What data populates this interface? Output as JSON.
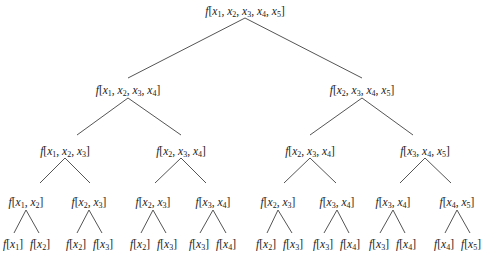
{
  "diagram": {
    "type": "binary-tree",
    "edge_color": "#555555",
    "nodes": [
      {
        "id": "n0",
        "label": "f[x1, x2, x3, x4, x5]",
        "args": [
          1,
          2,
          3,
          4,
          5
        ],
        "x": 245,
        "y": 12
      },
      {
        "id": "n1",
        "label": "f[x1, x2, x3, x4]",
        "args": [
          1,
          2,
          3,
          4
        ],
        "x": 128,
        "y": 91
      },
      {
        "id": "n2",
        "label": "f[x2, x3, x4, x5]",
        "args": [
          2,
          3,
          4,
          5
        ],
        "x": 362,
        "y": 91
      },
      {
        "id": "n3",
        "label": "f[x1, x2, x3]",
        "args": [
          1,
          2,
          3
        ],
        "x": 65,
        "y": 152
      },
      {
        "id": "n4",
        "label": "f[x2, x3, x4]",
        "args": [
          2,
          3,
          4
        ],
        "x": 181,
        "y": 152
      },
      {
        "id": "n5",
        "label": "f[x2, x3, x4]",
        "args": [
          2,
          3,
          4
        ],
        "x": 310,
        "y": 152
      },
      {
        "id": "n6",
        "label": "f[x3, x4, x5]",
        "args": [
          3,
          4,
          5
        ],
        "x": 425,
        "y": 152
      },
      {
        "id": "n7",
        "label": "f[x1, x2]",
        "args": [
          1,
          2
        ],
        "x": 26,
        "y": 203
      },
      {
        "id": "n8",
        "label": "f[x2, x3]",
        "args": [
          2,
          3
        ],
        "x": 89,
        "y": 203
      },
      {
        "id": "n9",
        "label": "f[x2, x3]",
        "args": [
          2,
          3
        ],
        "x": 153,
        "y": 203
      },
      {
        "id": "n10",
        "label": "f[x3, x4]",
        "args": [
          3,
          4
        ],
        "x": 213,
        "y": 203
      },
      {
        "id": "n11",
        "label": "f[x2, x3]",
        "args": [
          2,
          3
        ],
        "x": 278,
        "y": 203
      },
      {
        "id": "n12",
        "label": "f[x3, x4]",
        "args": [
          3,
          4
        ],
        "x": 337,
        "y": 203
      },
      {
        "id": "n13",
        "label": "f[x3, x4]",
        "args": [
          3,
          4
        ],
        "x": 393,
        "y": 203
      },
      {
        "id": "n14",
        "label": "f[x4, x5]",
        "args": [
          4,
          5
        ],
        "x": 457,
        "y": 203
      },
      {
        "id": "l0",
        "label": "f[x1]",
        "args": [
          1
        ],
        "x": 13,
        "y": 245
      },
      {
        "id": "l1",
        "label": "f[x2]",
        "args": [
          2
        ],
        "x": 40,
        "y": 245
      },
      {
        "id": "l2",
        "label": "f[x2]",
        "args": [
          2
        ],
        "x": 76,
        "y": 245
      },
      {
        "id": "l3",
        "label": "f[x3]",
        "args": [
          3
        ],
        "x": 103,
        "y": 245
      },
      {
        "id": "l4",
        "label": "f[x2]",
        "args": [
          2
        ],
        "x": 140,
        "y": 245
      },
      {
        "id": "l5",
        "label": "f[x3]",
        "args": [
          3
        ],
        "x": 167,
        "y": 245
      },
      {
        "id": "l6",
        "label": "f[x3]",
        "args": [
          3
        ],
        "x": 199,
        "y": 245
      },
      {
        "id": "l7",
        "label": "f[x4]",
        "args": [
          4
        ],
        "x": 226,
        "y": 245
      },
      {
        "id": "l8",
        "label": "f[x2]",
        "args": [
          2
        ],
        "x": 266,
        "y": 245
      },
      {
        "id": "l9",
        "label": "f[x3]",
        "args": [
          3
        ],
        "x": 293,
        "y": 245
      },
      {
        "id": "l10",
        "label": "f[x3]",
        "args": [
          3
        ],
        "x": 323,
        "y": 245
      },
      {
        "id": "l11",
        "label": "f[x4]",
        "args": [
          4
        ],
        "x": 350,
        "y": 245
      },
      {
        "id": "l12",
        "label": "f[x3]",
        "args": [
          3
        ],
        "x": 379,
        "y": 245
      },
      {
        "id": "l13",
        "label": "f[x4]",
        "args": [
          4
        ],
        "x": 406,
        "y": 245
      },
      {
        "id": "l14",
        "label": "f[x4]",
        "args": [
          4
        ],
        "x": 444,
        "y": 245
      },
      {
        "id": "l15",
        "label": "f[x5]",
        "args": [
          5
        ],
        "x": 471,
        "y": 245
      }
    ],
    "edges": [
      {
        "x1": 245,
        "y1": 18,
        "x2": 128,
        "y2": 78
      },
      {
        "x1": 245,
        "y1": 18,
        "x2": 362,
        "y2": 78
      },
      {
        "x1": 128,
        "y1": 98,
        "x2": 77,
        "y2": 135
      },
      {
        "x1": 128,
        "y1": 98,
        "x2": 181,
        "y2": 135
      },
      {
        "x1": 362,
        "y1": 98,
        "x2": 310,
        "y2": 135
      },
      {
        "x1": 362,
        "y1": 98,
        "x2": 413,
        "y2": 135
      },
      {
        "x1": 65,
        "y1": 158,
        "x2": 40,
        "y2": 183
      },
      {
        "x1": 65,
        "y1": 158,
        "x2": 90,
        "y2": 183
      },
      {
        "x1": 181,
        "y1": 158,
        "x2": 155,
        "y2": 183
      },
      {
        "x1": 181,
        "y1": 158,
        "x2": 206,
        "y2": 183
      },
      {
        "x1": 310,
        "y1": 158,
        "x2": 284,
        "y2": 183
      },
      {
        "x1": 310,
        "y1": 158,
        "x2": 336,
        "y2": 183
      },
      {
        "x1": 425,
        "y1": 158,
        "x2": 400,
        "y2": 183
      },
      {
        "x1": 425,
        "y1": 158,
        "x2": 451,
        "y2": 183
      },
      {
        "x1": 26,
        "y1": 210,
        "x2": 14,
        "y2": 233
      },
      {
        "x1": 26,
        "y1": 210,
        "x2": 39,
        "y2": 233
      },
      {
        "x1": 89,
        "y1": 210,
        "x2": 77,
        "y2": 233
      },
      {
        "x1": 89,
        "y1": 210,
        "x2": 102,
        "y2": 233
      },
      {
        "x1": 153,
        "y1": 210,
        "x2": 141,
        "y2": 233
      },
      {
        "x1": 153,
        "y1": 210,
        "x2": 166,
        "y2": 233
      },
      {
        "x1": 213,
        "y1": 210,
        "x2": 200,
        "y2": 233
      },
      {
        "x1": 213,
        "y1": 210,
        "x2": 226,
        "y2": 233
      },
      {
        "x1": 278,
        "y1": 210,
        "x2": 267,
        "y2": 233
      },
      {
        "x1": 278,
        "y1": 210,
        "x2": 292,
        "y2": 233
      },
      {
        "x1": 337,
        "y1": 210,
        "x2": 324,
        "y2": 233
      },
      {
        "x1": 337,
        "y1": 210,
        "x2": 349,
        "y2": 233
      },
      {
        "x1": 393,
        "y1": 210,
        "x2": 380,
        "y2": 233
      },
      {
        "x1": 393,
        "y1": 210,
        "x2": 405,
        "y2": 233
      },
      {
        "x1": 457,
        "y1": 210,
        "x2": 445,
        "y2": 233
      },
      {
        "x1": 457,
        "y1": 210,
        "x2": 470,
        "y2": 233
      }
    ]
  }
}
